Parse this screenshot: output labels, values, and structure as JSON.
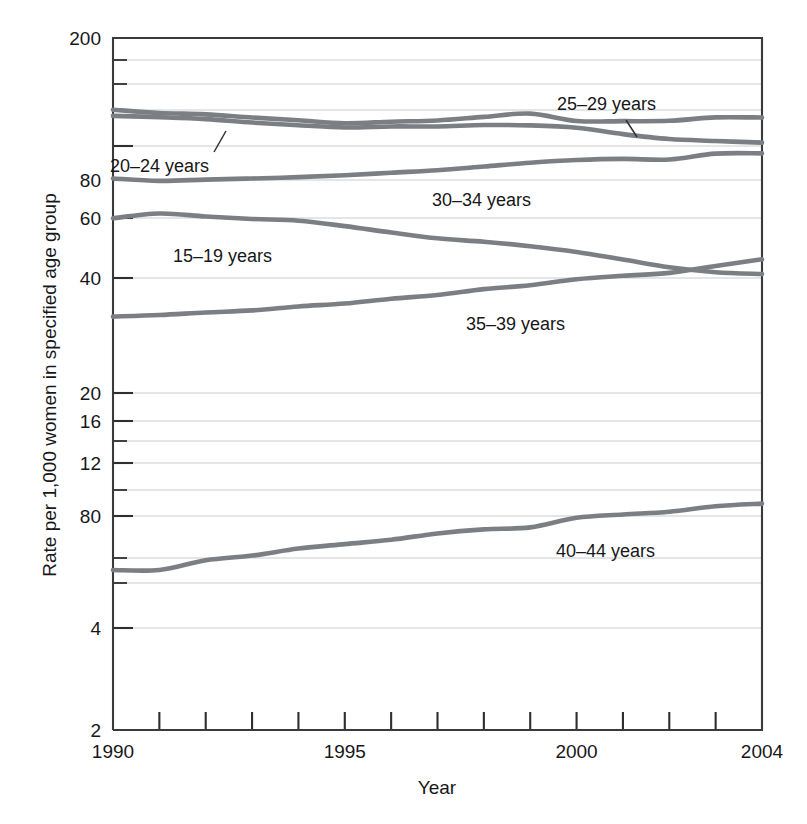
{
  "figure": {
    "xlabel": "Year",
    "ylabel": "Rate per 1,000 women in specified age group"
  },
  "axis": {
    "y_tick_labels": [
      "200",
      "80",
      "60",
      "40",
      "20",
      "16",
      "12",
      "80",
      "4",
      "2"
    ],
    "x_tick_labels": [
      "1990",
      "1995",
      "2000",
      "2004"
    ]
  },
  "series_labels": {
    "a15_19": "15–19 years",
    "a20_24": "20–24 years",
    "a25_29": "25–29 years",
    "a30_34": "30–34 years",
    "a35_39": "35–39 years",
    "a40_44": "40–44 years"
  },
  "colors": {
    "line": "#7b7f84",
    "grid": "#c9cbcd",
    "frame": "#3a3a3c",
    "text": "#17171a",
    "background": "#ffffff"
  },
  "chart_data": {
    "type": "line",
    "title": "",
    "xlabel": "Year",
    "ylabel": "Rate per 1,000 women in specified age group",
    "xlim": [
      1990,
      2004
    ],
    "ylim": [
      2,
      200
    ],
    "yscale": "log",
    "grid": true,
    "legend": "inline-annotations",
    "x": [
      1990,
      1991,
      1992,
      1993,
      1994,
      1995,
      1996,
      1997,
      1998,
      1999,
      2000,
      2001,
      2002,
      2003,
      2004
    ],
    "y_ticks_printed": [
      200,
      80,
      60,
      40,
      20,
      16,
      12,
      80,
      4,
      2
    ],
    "y_ticks_actual": [
      200,
      100,
      80,
      60,
      40,
      20,
      16,
      12,
      8.0,
      4,
      2
    ],
    "series": [
      {
        "name": "15–19 years",
        "values": [
          59.9,
          62.1,
          60.7,
          59.6,
          58.9,
          56.8,
          54.4,
          52.3,
          51.1,
          49.6,
          47.7,
          45.3,
          43.0,
          41.6,
          41.1
        ]
      },
      {
        "name": "20–24 years",
        "values": [
          116.5,
          115.7,
          114.6,
          112.6,
          111.1,
          109.8,
          110.4,
          110.4,
          111.2,
          111.0,
          109.7,
          106.2,
          103.6,
          102.6,
          101.7
        ]
      },
      {
        "name": "25–29 years",
        "values": [
          120.2,
          118.2,
          117.4,
          115.5,
          113.9,
          112.2,
          113.1,
          113.8,
          115.9,
          117.8,
          113.5,
          113.4,
          113.6,
          115.6,
          115.5
        ]
      },
      {
        "name": "30–34 years",
        "values": [
          80.8,
          79.5,
          80.2,
          80.8,
          81.5,
          82.5,
          83.9,
          85.3,
          87.4,
          89.6,
          91.2,
          91.9,
          91.5,
          95.1,
          95.3
        ]
      },
      {
        "name": "35–39 years",
        "values": [
          31.7,
          32.0,
          32.5,
          32.9,
          33.7,
          34.3,
          35.3,
          36.1,
          37.4,
          38.3,
          39.7,
          40.6,
          41.4,
          43.4,
          45.4
        ]
      },
      {
        "name": "40–44 years",
        "values": [
          5.5,
          5.5,
          5.9,
          6.1,
          6.4,
          6.6,
          6.8,
          7.1,
          7.3,
          7.4,
          7.9,
          8.1,
          8.3,
          8.7,
          8.9
        ]
      }
    ],
    "annotations": [
      {
        "text": "15–19 years",
        "x": 1992.6,
        "y": 47.0
      },
      {
        "text": "20–24 years",
        "x": 1991.4,
        "y": 89.0
      },
      {
        "text": "25–29 years",
        "x": 1998.8,
        "y": 148.0
      },
      {
        "text": "30–34 years",
        "x": 1995.9,
        "y": 66.0
      },
      {
        "text": "35–39 years",
        "x": 1996.6,
        "y": 27.0
      },
      {
        "text": "40–44 years",
        "x": 2000.4,
        "y": 6.9
      }
    ]
  }
}
